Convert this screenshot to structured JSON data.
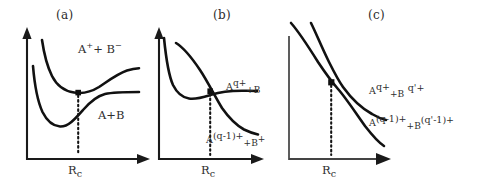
{
  "figure": {
    "background_color": "#ffffff",
    "ink_color": "#111111",
    "text_color": "#2e2e2e"
  },
  "panels": [
    {
      "id": "a",
      "title": "(a)",
      "axis": {
        "x_tick_label": "R",
        "x_tick_subscript": "c",
        "x_tick_label_full": "R_c"
      },
      "curve_labels": [
        {
          "name": "ionic-channel-label",
          "base": "A",
          "charge": "+",
          "plus": "+",
          "base2": "B",
          "charge2": "−",
          "full": "A+ + B−"
        },
        {
          "name": "neutral-channel-label",
          "full": "A+B"
        }
      ]
    },
    {
      "id": "b",
      "title": "(b)",
      "axis": {
        "x_tick_label": "R",
        "x_tick_subscript": "c",
        "x_tick_label_full": "R_c"
      },
      "curve_labels": [
        {
          "name": "initial-channel-label",
          "base": "A",
          "sup": "q+",
          "tail": "+B",
          "full": "A^{q+}+B"
        },
        {
          "name": "charge-transfer-channel-label",
          "base": "A",
          "sup": "(q-1)+",
          "tail_base": "+B",
          "tail_sup": "+",
          "full": "A^{(q-1)+}+B^{+}"
        }
      ]
    },
    {
      "id": "c",
      "title": "(c)",
      "axis": {
        "x_tick_label": "R",
        "x_tick_subscript": "c",
        "x_tick_label_full": "R_c"
      },
      "curve_labels": [
        {
          "name": "initial-channel-label",
          "base": "A",
          "sup": "q+",
          "mid": "+B",
          "mid_sup": "q'+",
          "full": "A^{q+}+B^{q'+}"
        },
        {
          "name": "charge-transfer-channel-label",
          "base": "A",
          "sup": "(q-1)+",
          "mid": "+B",
          "mid_sup": "(q'-1)+",
          "full": "A^{(q-1)+}+B^{(q'-1)+}"
        }
      ]
    }
  ]
}
